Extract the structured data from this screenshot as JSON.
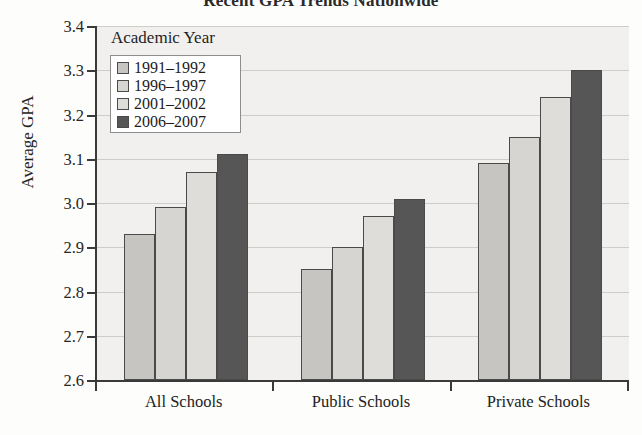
{
  "chart_data": {
    "type": "bar",
    "title": "Recent GPA Trends Nationwide",
    "xlabel": "",
    "ylabel": "Average GPA",
    "ylim": [
      2.6,
      3.4
    ],
    "ytick_step": 0.1,
    "yticks": [
      "3.4",
      "3.3",
      "3.2",
      "3.1",
      "3.0",
      "2.9",
      "2.8",
      "2.7",
      "2.6"
    ],
    "grid": true,
    "legend_position": "upper-left-inside",
    "legend_title": "Academic Year",
    "categories": [
      "All Schools",
      "Public Schools",
      "Private Schools"
    ],
    "series": [
      {
        "name": "1991–1992",
        "color": "#c6c5c2",
        "values": [
          2.93,
          2.85,
          3.09
        ]
      },
      {
        "name": "1996–1997",
        "color": "#d6d5d2",
        "values": [
          2.99,
          2.9,
          3.15
        ]
      },
      {
        "name": "2001–2002",
        "color": "#dedddA",
        "values": [
          3.07,
          2.97,
          3.24
        ]
      },
      {
        "name": "2006–2007",
        "color": "#565656",
        "values": [
          3.11,
          3.01,
          3.3
        ]
      }
    ]
  },
  "style": {
    "plot_background": "#f1f0ee",
    "axis_color": "#3a3a3a",
    "gridline_color": "#cfcdc9",
    "legend_background": "#ffffff",
    "bar_border": "#4a4a4a"
  },
  "footer": {
    "smudge_text": ""
  }
}
